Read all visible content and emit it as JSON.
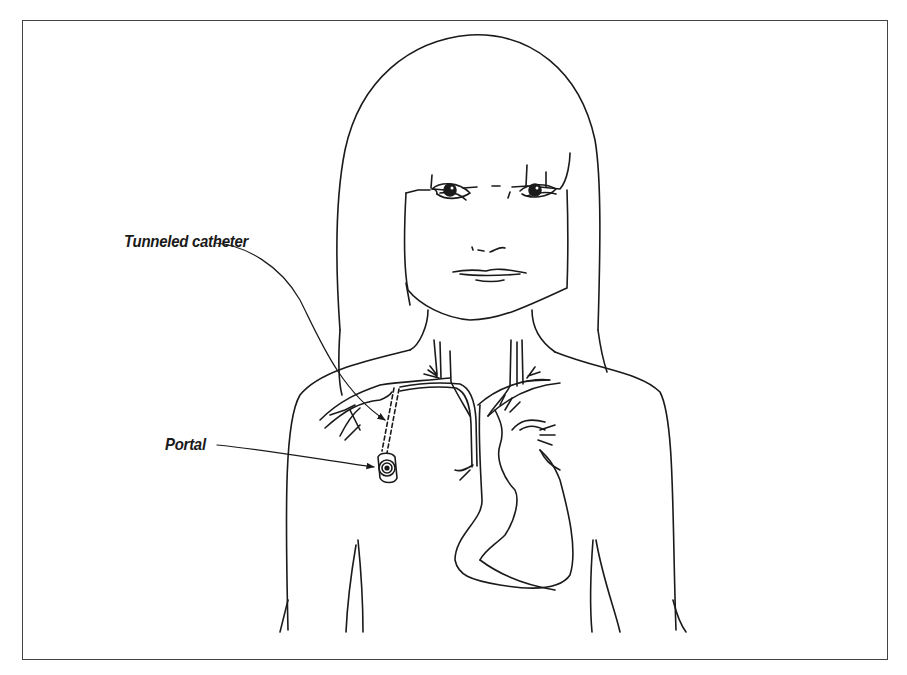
{
  "figure": {
    "labels": [
      {
        "id": "tunneled_catheter",
        "text": "Tunneled catheter"
      },
      {
        "id": "portal",
        "text": "Portal"
      }
    ]
  },
  "colors": {
    "line": "#1a1a1a",
    "frame": "#444444",
    "background": "#ffffff"
  }
}
